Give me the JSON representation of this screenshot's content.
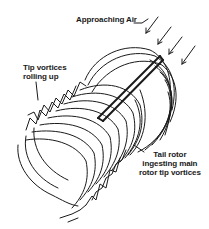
{
  "diagram": {
    "title": "Tail rotor ingesting main rotor tip vortices",
    "labels": {
      "approaching_air": "Approaching Air",
      "tip_vortices": [
        "Tip vortices",
        "rolling up"
      ],
      "tail_rotor": [
        "Tail rotor",
        "ingesting main",
        "rotor tip vortices"
      ]
    },
    "elements": [
      {
        "name": "approaching-air-arrows",
        "count": 4,
        "direction": "down-left"
      },
      {
        "name": "vortex-helix",
        "description": "series of stacked curved wake loops along a diagonal axis"
      },
      {
        "name": "tail-rotor-blade",
        "description": "thick diagonal bar through upper-right of helix"
      }
    ],
    "colors": {
      "ink": "#1a1a1a",
      "background": "#ffffff"
    }
  }
}
